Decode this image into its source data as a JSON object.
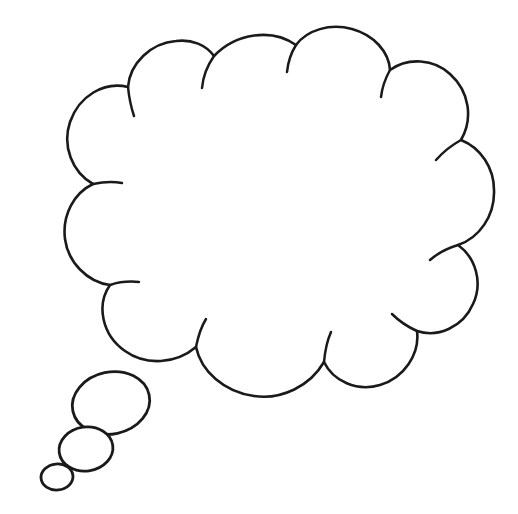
{
  "canvas": {
    "width": 518,
    "height": 514,
    "background_color": "#ffffff",
    "ink_color": "#1a1a1a",
    "stroke_width": 2.6,
    "title": "Thought Bubble Outline"
  },
  "drawing": {
    "name": "thought-bubble",
    "description": "Hand-drawn empty thought bubble (cloud callout) with three trailing bubbles toward the lower left",
    "style": "line-art",
    "fill": "none",
    "interior_text": ""
  },
  "cloud": {
    "name": "cloud-body",
    "bounds": {
      "x": 22,
      "y": 30,
      "width": 475,
      "height": 370
    },
    "lobe_count": 12,
    "outline_path": "M 214 56 C 236 33 272 28 296 45 C 307 30 330 23 352 29 C 374 35 389 52 390 70 C 408 57 434 59 450 74 C 470 92 473 119 461 140 C 481 148 494 168 494 190 C 495 216 479 238 458 245 C 476 258 483 283 473 304 C 463 327 438 338 417 331 C 420 354 404 378 380 385 C 357 392 333 381 324 362 C 310 386 282 400 254 396 C 224 392 201 371 196 347 C 176 364 146 366 125 351 C 102 335 96 305 110 285 C 87 282 68 262 65 239 C 62 215 74 193 93 184 C 72 172 62 146 70 122 C 79 96 104 81 128 87 C 130 63 151 43 176 41 C 192 39 206 45 214 56 Z",
    "scallop_hooks": [
      {
        "name": "hook-top-1",
        "path": "M 296 45 C 291 53 288 62 287 72"
      },
      {
        "name": "hook-top-2",
        "path": "M 390 70 C 385 79 382 88 381 97"
      },
      {
        "name": "hook-top-left",
        "path": "M 214 56 C 207 66 203 77 202 88"
      },
      {
        "name": "hook-right-1",
        "path": "M 461 140 C 452 145 443 152 436 160"
      },
      {
        "name": "hook-right-2",
        "path": "M 458 245 C 448 248 438 253 430 260"
      },
      {
        "name": "hook-right-3",
        "path": "M 417 331 C 408 327 399 321 392 314"
      },
      {
        "name": "hook-bottom-1",
        "path": "M 324 362 C 325 351 327 341 331 332"
      },
      {
        "name": "hook-bottom-2",
        "path": "M 196 347 C 198 337 201 327 206 319"
      },
      {
        "name": "hook-left-1",
        "path": "M 110 285 C 119 282 129 281 139 282"
      },
      {
        "name": "hook-left-2",
        "path": "M 93 184 C 102 182 112 181 122 183"
      },
      {
        "name": "hook-left-3",
        "path": "M 128 87 C 129 97 131 107 134 116"
      }
    ]
  },
  "tail_bubbles": [
    {
      "name": "tail-bubble-large",
      "order": 1,
      "cx": 111,
      "cy": 403,
      "rx": 39,
      "ry": 31,
      "rotation": -12
    },
    {
      "name": "tail-bubble-medium",
      "order": 2,
      "cx": 86,
      "cy": 449,
      "rx": 27,
      "ry": 22,
      "rotation": -8
    },
    {
      "name": "tail-bubble-small",
      "order": 3,
      "cx": 57,
      "cy": 477,
      "rx": 16,
      "ry": 13,
      "rotation": -5
    }
  ]
}
